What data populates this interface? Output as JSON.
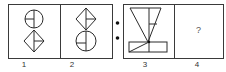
{
  "puzzle": {
    "panels": [
      {
        "label": "1",
        "content": "circle-above-diamond"
      },
      {
        "label": "2",
        "content": "diamond-above-circle"
      },
      {
        "label": "3",
        "content": "triangle-above-rectangle"
      },
      {
        "label": "4",
        "content": "?"
      }
    ],
    "question_mark": "?",
    "separator": "two-dots"
  },
  "colors": {
    "stroke": "#2a2a2a",
    "border": "#555555",
    "background": "#ffffff"
  }
}
